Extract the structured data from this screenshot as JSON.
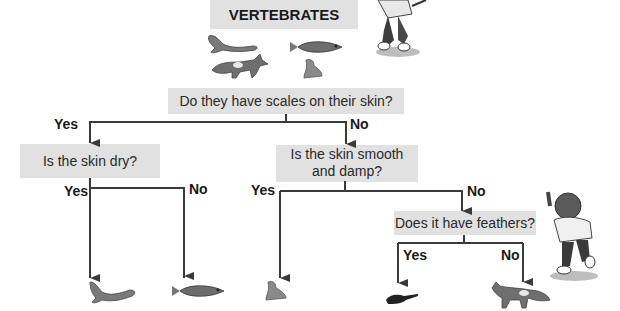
{
  "title": "VERTEBRATES",
  "questions": {
    "q1": "Do they have scales on their skin?",
    "q2": "Is the skin dry?",
    "q3_line1": "Is the skin smooth",
    "q3_line2": "and damp?",
    "q4": "Does it have feathers?"
  },
  "branch_labels": {
    "q1_yes": "Yes",
    "q1_no": "No",
    "q2_yes": "Yes",
    "q2_no": "No",
    "q3_yes": "Yes",
    "q3_no": "No",
    "q4_yes": "Yes",
    "q4_no": "No"
  },
  "header_animals": [
    "lizard-icon",
    "fox-icon",
    "fish-icon",
    "frog-icon"
  ],
  "leaf_animals": [
    {
      "name": "lizard-icon",
      "group": "reptile"
    },
    {
      "name": "fish-icon",
      "group": "fish"
    },
    {
      "name": "frog-icon",
      "group": "amphibian"
    },
    {
      "name": "bird-icon",
      "group": "bird"
    },
    {
      "name": "fox-icon",
      "group": "mammal"
    }
  ],
  "colors": {
    "box": "#e1e1e1",
    "line": "#3a3a3a"
  }
}
